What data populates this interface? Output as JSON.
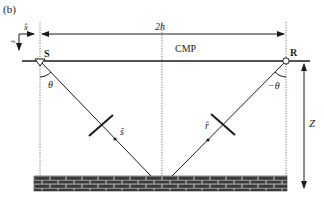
{
  "figure": {
    "panel_label": "(b)"
  },
  "labels": {
    "source": "S",
    "receiver": "R",
    "midpoint": "CMP",
    "offset": "2h",
    "depth": "Z",
    "angle_source": "θ",
    "angle_receiver": "−θ",
    "ray_source": "ŝ",
    "ray_receiver": "r̂",
    "axis_x": "x̂",
    "axis_z": "ẑ"
  },
  "colors": {
    "line": "#1a1a1a",
    "dotted": "#555555",
    "brick_fill": "#3a3a3a",
    "brick_mortar": "#9a9a9a",
    "background": "#ffffff"
  },
  "geometry": {
    "source_x": 40,
    "receiver_x": 286,
    "cmp_x": 162,
    "surface_y": 61,
    "reflector_top_y": 176,
    "reflector_bottom_y": 191
  }
}
